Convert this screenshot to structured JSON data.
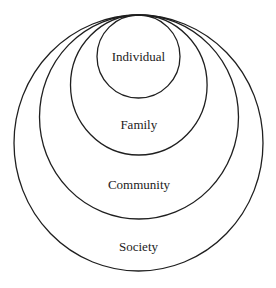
{
  "diagram": {
    "type": "nested-circles",
    "background": "#ffffff",
    "stroke_color": "#1f1f1f",
    "text_color": "#222222",
    "levels": [
      {
        "label": "Society",
        "cx": 138.5,
        "cy": 143,
        "rx": 124.5,
        "ry": 128,
        "label_y": 246
      },
      {
        "label": "Community",
        "cx": 139,
        "cy": 117,
        "rx": 99.5,
        "ry": 102,
        "label_y": 184
      },
      {
        "label": "Family",
        "cx": 138.8,
        "cy": 85,
        "rx": 68.3,
        "ry": 70,
        "label_y": 124
      },
      {
        "label": "Individual",
        "cx": 138.5,
        "cy": 56.5,
        "rx": 41.5,
        "ry": 41.5,
        "label_y": 56
      }
    ]
  }
}
